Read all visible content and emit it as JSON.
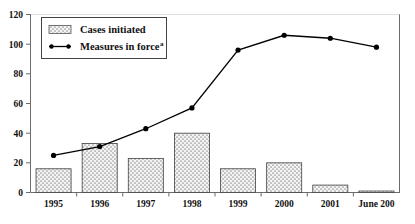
{
  "chart_data": {
    "type": "bar",
    "title": "",
    "subtitle": "",
    "xlabel": "",
    "ylabel": "",
    "ylim": [
      0,
      120
    ],
    "yticks": [
      0,
      20,
      40,
      60,
      80,
      100,
      120
    ],
    "grid": false,
    "legend_position": "top-left",
    "categories": [
      "1995",
      "1996",
      "1997",
      "1998",
      "1999",
      "2000",
      "2001",
      "June 200"
    ],
    "series": [
      {
        "name": "Cases initiated",
        "type": "bar",
        "values": [
          16,
          33,
          23,
          40,
          16,
          20,
          5,
          1
        ]
      },
      {
        "name": "Measures in force",
        "type": "line",
        "superscript": "a",
        "values": [
          25,
          31,
          43,
          57,
          96,
          106,
          104,
          98
        ]
      }
    ],
    "legend": [
      {
        "label": "Cases initiated",
        "superscript": "",
        "marker": "patterned-box"
      },
      {
        "label": "Measures in force",
        "superscript": "a",
        "marker": "line-with-dots"
      }
    ],
    "colors": {
      "bar_fill": "#f2f2f2",
      "bar_pattern": "#808080",
      "bar_edge": "#404040",
      "line": "#000000",
      "marker": "#000000",
      "axis": "#6b6b6b",
      "text": "#111111",
      "background": "#ffffff"
    }
  }
}
